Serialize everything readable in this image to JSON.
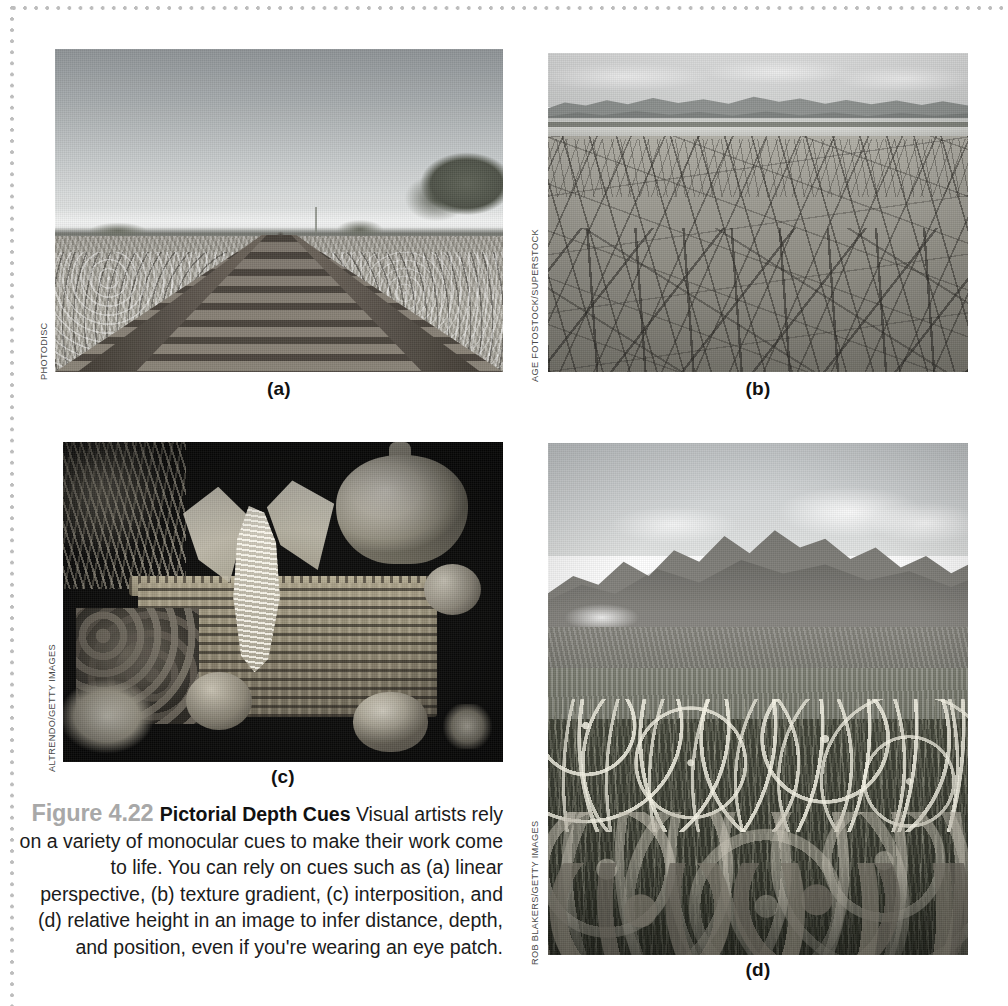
{
  "figure": {
    "number_label": "Figure 4.22",
    "title": "Pictorial Depth Cues",
    "body": " Visual artists rely on a variety of monocular cues to make their work come to life. You can rely on cues such as (a) linear perspective, (b) texture gradient, (c) interposition, and (d) relative height in an image to infer distance, depth, and position, even if you're wearing an eye patch."
  },
  "panels": [
    {
      "id": "a",
      "label": "(a)",
      "credit": "PHOTODISC",
      "description": "Black and white photograph of a railroad track receding to a vanishing point on a flat plain, illustrating linear perspective."
    },
    {
      "id": "b",
      "label": "(b)",
      "credit": "AGE FOTOSTOCK/SUPERSTOCK",
      "description": "Black and white photograph of a dry cracked mud playa with distant mountain range, illustrating texture gradient."
    },
    {
      "id": "c",
      "label": "(c)",
      "credit": "ALTRENDO/GETTY IMAGES",
      "description": "Black and white still life of an autumn harvest basket with corn, pumpkin, grapes and gourds overlapping one another, illustrating interposition."
    },
    {
      "id": "d",
      "label": "(d)",
      "credit": "ROB BLAKERS/GETTY IMAGES",
      "description": "Black and white photograph of an alpine wildflower meadow with a jagged mountain peak behind, illustrating relative height."
    }
  ],
  "colors": {
    "page_background": "#ffffff",
    "dot_rule": "#bdbdbd",
    "figure_number": "#a8a8a8",
    "caption_text": "#1b1b1b"
  }
}
